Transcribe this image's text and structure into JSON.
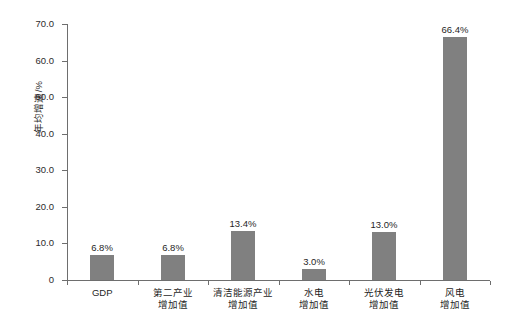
{
  "chart_data": {
    "type": "bar",
    "title": "",
    "xlabel": "",
    "ylabel": "年均增速/%",
    "ylim": [
      0,
      70
    ],
    "ytick_values": [
      70.0,
      60.0,
      50.0,
      40.0,
      30.0,
      20.0,
      10.0,
      0
    ],
    "ytick_labels": [
      "70.0",
      "60.0",
      "50.0",
      "40.0",
      "30.0",
      "20.0",
      "10.0",
      "0"
    ],
    "grid": false,
    "legend": false,
    "bar_color": "#808080",
    "axis_color": "#6e6e6e",
    "categories": [
      "GDP",
      "第二产业增加值",
      "清洁能源产业增加值",
      "水电增加值",
      "光伏发电增加值",
      "风电增加值"
    ],
    "category_label_lines": [
      [
        "GDP",
        ""
      ],
      [
        "第二产业",
        "增加值"
      ],
      [
        "清洁能源产业",
        "增加值"
      ],
      [
        "水电",
        "增加值"
      ],
      [
        "光伏发电",
        "增加值"
      ],
      [
        "风电",
        "增加值"
      ]
    ],
    "values": [
      6.8,
      6.8,
      13.4,
      3.0,
      13.0,
      66.4
    ],
    "data_labels": [
      "6.8%",
      "6.8%",
      "13.4%",
      "3.0%",
      "13.0%",
      "66.4%"
    ]
  }
}
